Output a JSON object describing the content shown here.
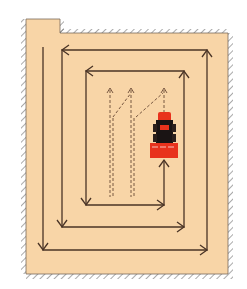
{
  "diagram": {
    "type": "mowing-pattern-spiral",
    "colors": {
      "field": "#f8d5a7",
      "wall": "#555555",
      "path": "#4a3426",
      "dashed_path": "#6a4a36",
      "mower_red": "#e8321c",
      "mower_black": "#1a1414"
    },
    "field_outline": {
      "notch": {
        "x1": 26,
        "x2": 60,
        "top": 19
      },
      "top_wall_y": 33,
      "right_wall_x": 228,
      "bottom_wall_y": 274,
      "left_wall_x": 26
    },
    "spiral_path": [
      [
        43,
        47
      ],
      [
        43,
        250
      ],
      [
        207,
        250
      ],
      [
        207,
        50
      ],
      [
        62,
        50
      ],
      [
        62,
        227
      ],
      [
        184,
        227
      ],
      [
        184,
        71
      ],
      [
        86,
        71
      ],
      [
        86,
        205
      ],
      [
        164,
        205
      ],
      [
        164,
        160
      ]
    ],
    "arrow_heads": [
      {
        "x": 43,
        "y": 250,
        "dir": "down"
      },
      {
        "x": 207,
        "y": 250,
        "dir": "right"
      },
      {
        "x": 207,
        "y": 50,
        "dir": "up"
      },
      {
        "x": 62,
        "y": 50,
        "dir": "left"
      },
      {
        "x": 62,
        "y": 227,
        "dir": "down"
      },
      {
        "x": 184,
        "y": 227,
        "dir": "right"
      },
      {
        "x": 184,
        "y": 71,
        "dir": "up"
      },
      {
        "x": 86,
        "y": 71,
        "dir": "left"
      },
      {
        "x": 86,
        "y": 205,
        "dir": "down"
      },
      {
        "x": 164,
        "y": 205,
        "dir": "right"
      },
      {
        "x": 164,
        "y": 160,
        "dir": "up"
      }
    ],
    "dashed_paths": [
      {
        "name": "lane-1",
        "x": 110,
        "y_top": 89
      },
      {
        "name": "lane-2",
        "x": 131,
        "y_top": 89
      },
      {
        "name": "lane-3",
        "x": 164,
        "y_top": 89
      }
    ],
    "vehicle": {
      "label": "ride-on-mower",
      "x": 150,
      "y": 112,
      "w": 28,
      "h": 47
    }
  }
}
